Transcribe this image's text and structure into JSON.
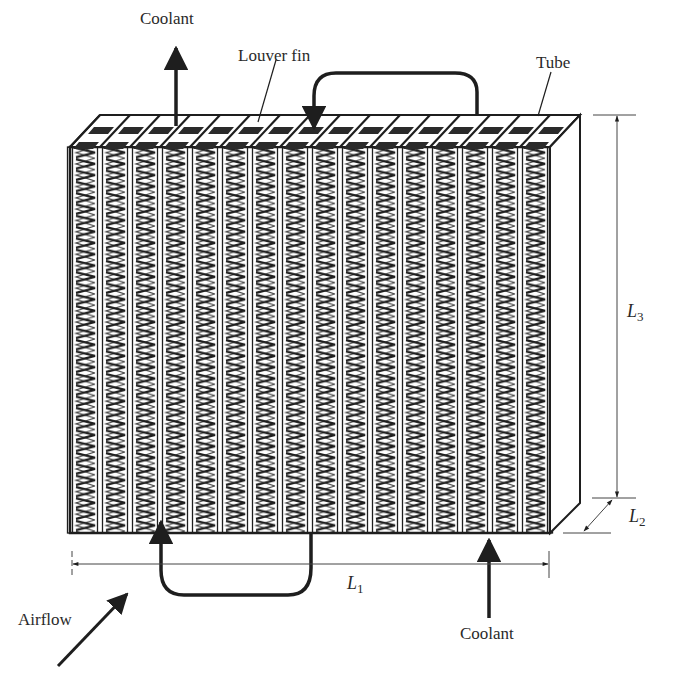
{
  "diagram": {
    "type": "heat-exchanger-schematic",
    "labels": {
      "coolant_out": "Coolant",
      "coolant_in": "Coolant",
      "louver_fin": "Louver fin",
      "tube": "Tube",
      "airflow": "Airflow"
    },
    "dimensions": {
      "L1": {
        "symbol": "L",
        "sub": "1",
        "meaning": "core width"
      },
      "L2": {
        "symbol": "L",
        "sub": "2",
        "meaning": "core depth"
      },
      "L3": {
        "symbol": "L",
        "sub": "3",
        "meaning": "core height"
      }
    },
    "core": {
      "columns": 16,
      "fin_rows": 34
    },
    "colors": {
      "ink": "#1e1e1e",
      "background": "#ffffff",
      "label_text": "#2a2a2a"
    }
  }
}
